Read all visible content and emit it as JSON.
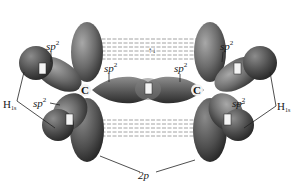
{
  "diagram": {
    "title": "",
    "molecule": "ethylene",
    "atoms": {
      "carbon_left": "C",
      "carbon_right": "C",
      "hydrogen_label_left": "H",
      "hydrogen_sub_left": "1s",
      "hydrogen_label_right": "H",
      "hydrogen_sub_right": "1s"
    },
    "labels": {
      "sp2_base": "sp",
      "sp2_sup": "2",
      "p_orbital": "2p",
      "electron_pair": "↑↓"
    },
    "orbital_labels": [
      {
        "id": "sp2-top-left",
        "text": "sp",
        "sup": "2"
      },
      {
        "id": "sp2-left-lower",
        "text": "sp",
        "sup": "2"
      },
      {
        "id": "sp2-center-left",
        "text": "sp",
        "sup": "2"
      },
      {
        "id": "sp2-center-right",
        "text": "sp",
        "sup": "2"
      },
      {
        "id": "sp2-top-right",
        "text": "sp",
        "sup": "2"
      },
      {
        "id": "sp2-right-lower",
        "text": "sp",
        "sup": "2"
      }
    ],
    "colors": {
      "lobe_dark": "#3a3a3a",
      "lobe_mid": "#6e6e6e",
      "lobe_light": "#9a9a9a",
      "hydrogen_sphere": "#555555",
      "pi_overlap_lines": "#8a8a8a",
      "label_text": "#1a1a1a",
      "background": "#ffffff"
    }
  }
}
